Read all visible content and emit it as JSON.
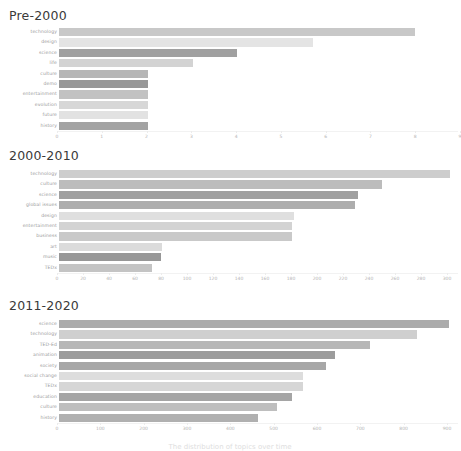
{
  "figure": {
    "caption": "The distribution of topics over time",
    "background": "#ffffff"
  },
  "chart_data": [
    {
      "type": "bar",
      "orientation": "horizontal",
      "title": "Pre-2000",
      "xlabel": "",
      "ylabel": "",
      "xlim": [
        0,
        9
      ],
      "grid": false,
      "legend": "none",
      "ticks": [
        "0",
        "1",
        "2",
        "3",
        "4",
        "5",
        "6",
        "7",
        "8",
        "9"
      ],
      "categories": [
        "technology",
        "design",
        "science",
        "life",
        "culture",
        "demo",
        "entertainment",
        "evolution",
        "future",
        "history"
      ],
      "values": [
        8.0,
        5.7,
        4.0,
        3.0,
        2.0,
        2.0,
        2.0,
        2.0,
        2.0,
        2.0
      ],
      "colors": [
        "#c3c3c3",
        "#e2e2e2",
        "#989898",
        "#cfcfcf",
        "#b0b0b0",
        "#8f8f8f",
        "#bdbdbd",
        "#d4d4d4",
        "#e0e0e0",
        "#9b9b9b"
      ]
    },
    {
      "type": "bar",
      "orientation": "horizontal",
      "title": "2000-2010",
      "xlabel": "",
      "ylabel": "",
      "xlim": [
        0,
        310
      ],
      "grid": false,
      "legend": "none",
      "ticks": [
        "0",
        "20",
        "40",
        "60",
        "80",
        "100",
        "120",
        "140",
        "160",
        "180",
        "200",
        "220",
        "240",
        "260",
        "280",
        "300"
      ],
      "categories": [
        "technology",
        "culture",
        "science",
        "global issues",
        "design",
        "entertainment",
        "business",
        "art",
        "music",
        "TEDx"
      ],
      "values": [
        302,
        250,
        231,
        229,
        182,
        180,
        180,
        80,
        79,
        72
      ],
      "colors": [
        "#c9c9c9",
        "#b6b6b6",
        "#989898",
        "#a6a6a6",
        "#dcdcdc",
        "#cfcfcf",
        "#c4c4c4",
        "#d8d8d8",
        "#8e8e8e",
        "#bfbfbf"
      ]
    },
    {
      "type": "bar",
      "orientation": "horizontal",
      "title": "2011-2020",
      "xlabel": "",
      "ylabel": "",
      "xlim": [
        0,
        930
      ],
      "grid": false,
      "legend": "none",
      "ticks": [
        "0",
        "100",
        "200",
        "300",
        "400",
        "500",
        "600",
        "700",
        "800",
        "900"
      ],
      "categories": [
        "science",
        "technology",
        "TED-Ed",
        "animation",
        "society",
        "social change",
        "TEDx",
        "education",
        "culture",
        "history"
      ],
      "values": [
        905,
        830,
        722,
        640,
        620,
        565,
        565,
        540,
        505,
        462
      ],
      "colors": [
        "#a4a4a4",
        "#cbcbcb",
        "#b1b1b1",
        "#949494",
        "#a0a0a0",
        "#dadada",
        "#d2d2d2",
        "#9d9d9d",
        "#b8b8b8",
        "#a9a9a9"
      ]
    }
  ]
}
